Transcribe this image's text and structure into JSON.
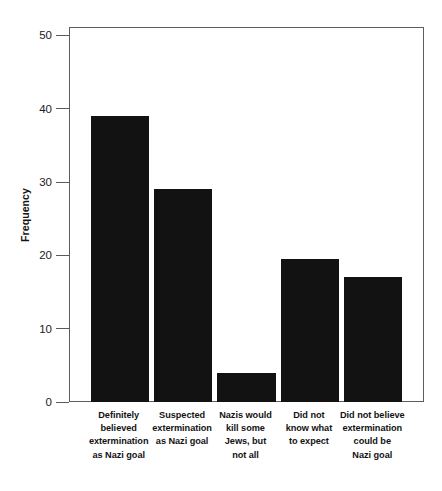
{
  "chart_data": {
    "type": "bar",
    "title": "",
    "xlabel": "",
    "ylabel": "Frequency",
    "ylim": [
      0,
      51
    ],
    "yticks": [
      0,
      10,
      20,
      30,
      40,
      50
    ],
    "ytick_labels": [
      "0",
      "10",
      "20",
      "30",
      "40",
      "50"
    ],
    "grid": false,
    "legend": null,
    "bar_color": "#121212",
    "axis_color": "#5d5d5d",
    "categories": [
      "Definitely believed extermination as Nazi goal",
      "Suspected extermination as Nazi goal",
      "Nazis would kill some Jews, but not all",
      "Did not know what to expect",
      "Did not believe extermination could be Nazi goal"
    ],
    "category_lines": [
      [
        "Definitely",
        "believed",
        "extermination",
        "as Nazi goal"
      ],
      [
        "Suspected",
        "extermination",
        "as Nazi goal"
      ],
      [
        "Nazis would",
        "kill some",
        "Jews, but",
        "not all"
      ],
      [
        "Did not",
        "know what",
        "to expect"
      ],
      [
        "Did not believe",
        "extermination",
        "could be",
        "Nazi goal"
      ]
    ],
    "values": [
      39,
      29,
      4,
      19.5,
      17
    ]
  }
}
